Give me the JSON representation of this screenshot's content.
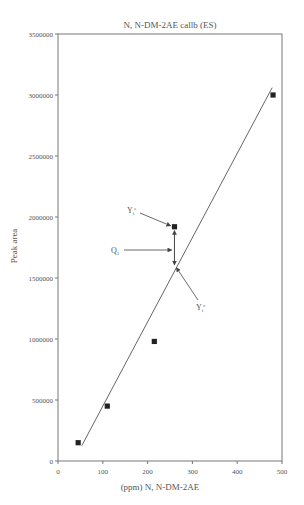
{
  "chart_data": {
    "type": "scatter",
    "title": "N, N-DM-2AE callb (ES)",
    "xlabel": "(ppm) N, N-DM-2AE",
    "ylabel": "Peak area",
    "xlim": [
      0,
      500
    ],
    "ylim": [
      0,
      3500000
    ],
    "x_ticks": [
      0,
      100,
      200,
      300,
      400,
      500
    ],
    "y_ticks": [
      0,
      500000,
      1000000,
      1500000,
      2000000,
      2500000,
      3000000,
      3500000
    ],
    "x_tick_labels": [
      "0",
      "100",
      "200",
      "300",
      "400",
      "500"
    ],
    "y_tick_labels": [
      "0",
      "500000",
      "1000000",
      "1500000",
      "2000000",
      "2500000",
      "3000000",
      "3500000"
    ],
    "grid": false,
    "series": [
      {
        "name": "Calibration points",
        "marker": "square",
        "x": [
          45,
          110,
          215,
          260,
          480
        ],
        "y": [
          150000,
          450000,
          980000,
          1920000,
          3000000
        ]
      },
      {
        "name": "Regression line",
        "type": "line",
        "x": [
          53,
          478
        ],
        "y": [
          125000,
          3060000
        ]
      }
    ],
    "annotations": [
      {
        "label": "Yi^e",
        "sub": "i",
        "sup": "e",
        "points_to": "observed point (260, 1920000)"
      },
      {
        "label": "Q1",
        "points_to": "residual between observed and fitted"
      },
      {
        "label": "Yi^c",
        "sub": "i",
        "sup": "c",
        "points_to": "fitted value on line (260, 1600000)"
      }
    ]
  },
  "labels": {
    "title": "N, N-DM-2AE callb (ES)",
    "xlabel": "(ppm) N, N-DM-2AE",
    "ylabel": "Peak area",
    "ann_ye": "Y",
    "ann_ye_sup": "e",
    "ann_ye_sub": "i",
    "ann_q": "Q",
    "ann_q_sub": "1",
    "ann_yc": "Y",
    "ann_yc_sup": "c",
    "ann_yc_sub": "i"
  }
}
